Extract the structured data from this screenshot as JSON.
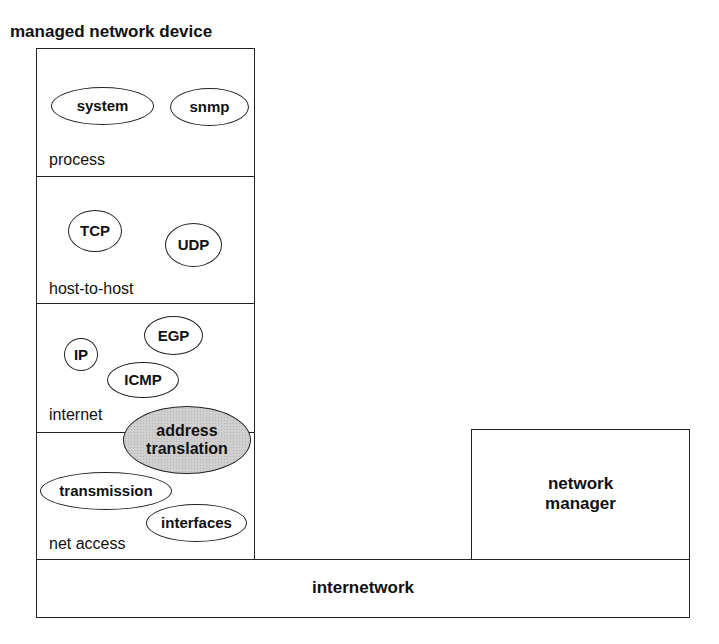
{
  "title": "managed network device",
  "device": {
    "layers": [
      {
        "name": "process",
        "modules": [
          "system",
          "snmp"
        ]
      },
      {
        "name": "host-to-host",
        "modules": [
          "TCP",
          "UDP"
        ]
      },
      {
        "name": "internet",
        "modules": [
          "IP",
          "EGP",
          "ICMP"
        ]
      },
      {
        "name": "net access",
        "modules": [
          "transmission",
          "interfaces"
        ]
      }
    ],
    "shared_module": {
      "label_line1": "address",
      "label_line2": "translation",
      "fill": "#cfcfcf"
    }
  },
  "manager": {
    "label_line1": "network",
    "label_line2": "manager"
  },
  "network": {
    "label": "internetwork"
  },
  "colors": {
    "stroke": "#222222",
    "background": "#ffffff",
    "shaded": "#cfcfcf"
  }
}
